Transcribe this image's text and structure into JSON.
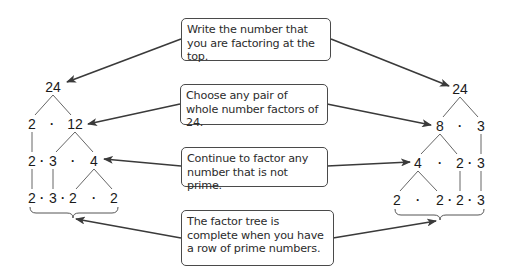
{
  "callouts": [
    {
      "id": "write-top",
      "text": "Write the number that you are factoring at the top."
    },
    {
      "id": "choose-pair",
      "text": "Choose any pair of whole number factors of 24."
    },
    {
      "id": "continue-factor",
      "text": "Continue to factor any number that is not prime."
    },
    {
      "id": "tree-complete",
      "text": "The factor tree is complete when you have a row of prime numbers."
    }
  ],
  "left_tree": {
    "root": "24",
    "row2": [
      "2",
      "·",
      "12"
    ],
    "row3": [
      "2",
      "·",
      "3",
      "·",
      "4"
    ],
    "row4": [
      "2",
      "·",
      "3",
      "·",
      "2",
      "·",
      "2"
    ]
  },
  "right_tree": {
    "root": "24",
    "row2": [
      "8",
      "·",
      "3"
    ],
    "row3": [
      "4",
      "·",
      "2",
      "·",
      "3"
    ],
    "row4": [
      "2",
      "·",
      "2",
      "·",
      "2",
      "·",
      "3"
    ]
  },
  "colors": {
    "line": "#555555",
    "arrow": "#3a3a3a",
    "text": "#1a1a1a",
    "box_border": "#4a4a4a"
  }
}
